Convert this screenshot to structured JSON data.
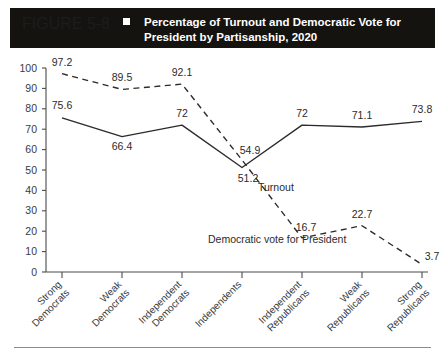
{
  "header": {
    "figure_number": "FIGURE 5-8",
    "bullet_icon": "square-icon",
    "title_line1": "Percentage of Turnout and Democratic Vote for",
    "title_line2": "President by Partisanship, 2020",
    "background_color": "#15130f",
    "text_color": "#ffffff"
  },
  "chart_data": {
    "type": "line",
    "title": "Percentage of Turnout and Democratic Vote for President by Partisanship, 2020",
    "xlabel": "",
    "ylabel": "",
    "ylim": [
      0,
      100
    ],
    "yticks": [
      100,
      90,
      80,
      70,
      60,
      50,
      40,
      30,
      20,
      10,
      0
    ],
    "grid": false,
    "legend": "inline-annotations",
    "categories": [
      "Strong Democrats",
      "Weak Democrats",
      "Independent Democrats",
      "Independents",
      "Independent Republicans",
      "Weak Republicans",
      "Strong Republicans"
    ],
    "category_lines": [
      [
        "Strong",
        "Democrats"
      ],
      [
        "Weak",
        "Democrats"
      ],
      [
        "Independent",
        "Democrats"
      ],
      [
        "Independents",
        ""
      ],
      [
        "Independent",
        "Republicans"
      ],
      [
        "Weak",
        "Republicans"
      ],
      [
        "Strong",
        "Republicans"
      ]
    ],
    "series": [
      {
        "name": "Turnout",
        "style": "solid",
        "color": "#2b2b2b",
        "values": [
          75.6,
          66.4,
          72,
          51.2,
          72,
          71.1,
          73.8
        ],
        "value_labels": [
          "75.6",
          "66.4",
          "72",
          "51.2",
          "72",
          "71.1",
          "73.8"
        ]
      },
      {
        "name": "Democratic vote for President",
        "style": "dashed",
        "color": "#2b2b2b",
        "values": [
          97.2,
          89.5,
          92.1,
          54.9,
          16.7,
          22.7,
          3.7
        ],
        "value_labels": [
          "97.2",
          "89.5",
          "92.1",
          "54.9",
          "16.7",
          "22.7",
          "3.7"
        ]
      }
    ],
    "annotations": [
      {
        "text": "Turnout",
        "series": "Turnout"
      },
      {
        "text": "Democratic vote for President",
        "series": "Democratic vote for President"
      }
    ]
  }
}
